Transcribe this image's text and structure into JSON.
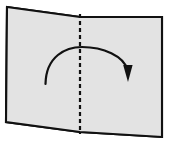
{
  "figure": {
    "name": "origami-valley-fold-step",
    "background_color": "#ffffff"
  },
  "paper": {
    "name": "paper-sheet",
    "fill_color": "#e3e3e3",
    "stroke_color": "#111111",
    "stroke_width": 2.1,
    "outline_points": "7,7 80,17 162,17 162,137 80,132 6,122",
    "left_panel_points": "7,7 80,17 80,132 6,122",
    "right_panel_points": "80,17 162,17 162,137 80,132",
    "corners": {
      "top_left": [
        7,
        7
      ],
      "top_center": [
        80,
        17
      ],
      "top_right": [
        162,
        17
      ],
      "bottom_right": [
        162,
        137
      ],
      "bottom_center": [
        80,
        132
      ],
      "bottom_left": [
        6,
        122
      ]
    }
  },
  "fold_line": {
    "name": "valley-fold-crease",
    "style": "dashed",
    "color": "#111111",
    "width": 2.2,
    "dash_pattern": "4 3",
    "x": 80,
    "y_start": 14,
    "y_end": 134
  },
  "fold_arrow": {
    "name": "fold-direction-arrow",
    "color": "#111111",
    "width": 2.2,
    "path": "M 45.5,84 C 46,56 66,47 82,47 C 103,47 124,56 127.5,70",
    "direction": "left-to-right-over-crease",
    "head": {
      "tip": [
        128,
        82
      ],
      "points": "128,82 123.2,65 132.6,65"
    }
  },
  "labels": {
    "caption": ""
  }
}
